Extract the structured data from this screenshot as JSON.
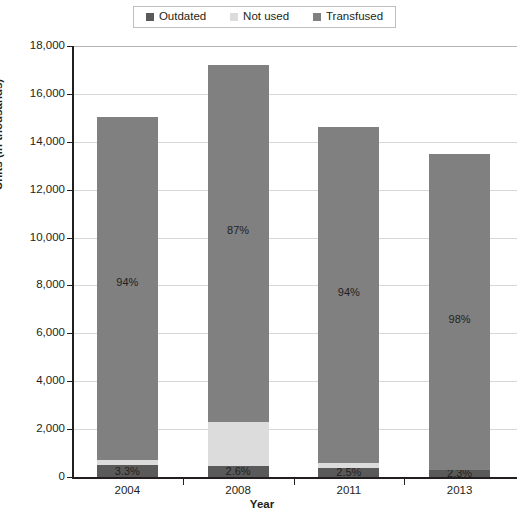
{
  "chart_data": {
    "type": "bar",
    "subtype": "stacked-bar",
    "title": "",
    "xlabel": "Year",
    "ylabel": "Units (in thousands)",
    "categories": [
      "2004",
      "2008",
      "2011",
      "2013"
    ],
    "ylim": [
      0,
      18000
    ],
    "ytick_step": 2000,
    "ytick_labels": [
      "0",
      "2,000",
      "4,000",
      "6,000",
      "8,000",
      "10,000",
      "12,000",
      "14,000",
      "16,000",
      "18,000"
    ],
    "ytick_values": [
      0,
      2000,
      4000,
      6000,
      8000,
      10000,
      12000,
      14000,
      16000,
      18000
    ],
    "grid": true,
    "legend_position": "top-center",
    "stack_order_bottom_to_top": [
      "Outdated",
      "Not used",
      "Transfused"
    ],
    "series": [
      {
        "name": "Outdated",
        "color": "#5a5a5a",
        "values": [
          500,
          450,
          365,
          310
        ],
        "data_labels": [
          "3.3%",
          "2.6%",
          "2.5%",
          "2.3%"
        ]
      },
      {
        "name": "Not used",
        "color": "#dcdcdc",
        "values": [
          210,
          1850,
          235,
          0
        ],
        "data_labels": [
          "",
          "",
          "",
          ""
        ]
      },
      {
        "name": "Transfused",
        "color": "#808080",
        "values": [
          14340,
          14900,
          14000,
          13190
        ],
        "data_labels": [
          "94%",
          "87%",
          "94%",
          "98%"
        ]
      }
    ],
    "totals": [
      15050,
      17200,
      14600,
      13500
    ]
  },
  "legend": {
    "items": [
      {
        "label": "Outdated",
        "color": "#5a5a5a"
      },
      {
        "label": "Not used",
        "color": "#dcdcdc"
      },
      {
        "label": "Transfused",
        "color": "#808080"
      }
    ]
  },
  "axes": {
    "y_title": "Units (in thousands)",
    "x_title": "Year"
  }
}
